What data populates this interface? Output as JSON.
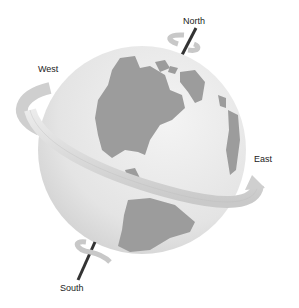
{
  "diagram": {
    "labels": {
      "north": "North",
      "south": "South",
      "east": "East",
      "west": "West"
    },
    "colors": {
      "ocean": "#e6e6e6",
      "land": "#9a9a9a",
      "band": "#d8d8d8",
      "axis": "#333333",
      "text": "#222222"
    }
  }
}
